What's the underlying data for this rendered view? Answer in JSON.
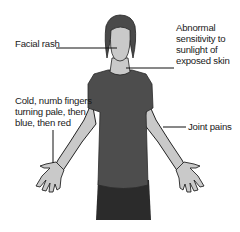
{
  "diagram": {
    "labels": {
      "facial_rash": "Facial rash",
      "sensitivity": [
        "Abnormal",
        "sensitivity to",
        "sunlight of",
        "exposed skin"
      ],
      "cold_fingers": [
        "Cold, numb fingers",
        "turning pale, then",
        "blue, then red"
      ],
      "joint_pains": "Joint pains"
    },
    "colors": {
      "hair": "#4a4a4a",
      "skin": "#c9c9c9",
      "shirt": "#4d4d4d",
      "pants": "#2b2b2b",
      "outline": "#222222",
      "leader_line": "#111111",
      "text": "#1a1a1a"
    }
  }
}
